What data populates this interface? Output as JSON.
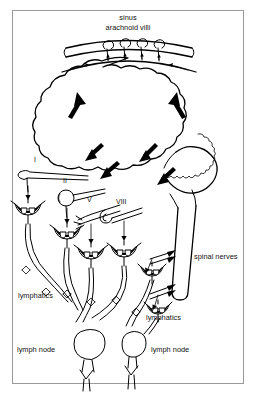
{
  "figure": {
    "title_lines": [
      "sinus",
      "arachnoid villi"
    ],
    "top_label_1": "sinus",
    "top_label_2": "arachnoid villi",
    "labels": {
      "spinal_nerves": "spinal nerves",
      "lymphatics_left": "lymphatics",
      "lymphatics_right": "lymphatics",
      "lymph_node_left": "lymph node",
      "lymph_node_right": "lymph node"
    },
    "cranial_nerves": [
      {
        "roman": "I",
        "name": "olfactory"
      },
      {
        "roman": "II",
        "name": "optic"
      },
      {
        "roman": "V",
        "name": "trigeminal"
      },
      {
        "roman": "VIII",
        "name": "vestibulocochlear"
      }
    ],
    "colors": {
      "ink": "#000000",
      "frame": "#9a9a9a",
      "background": "#ffffff"
    },
    "counts": {
      "arachnoid_villi": 4,
      "flow_arrows_in_brain": 6,
      "lymph_nodes": 2,
      "spinal_nerve_pairs": 2
    }
  }
}
